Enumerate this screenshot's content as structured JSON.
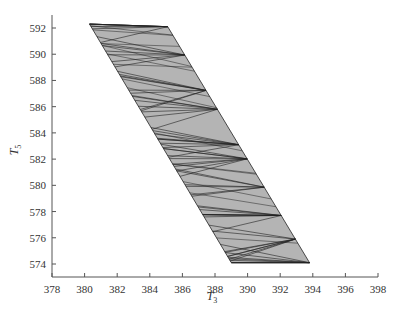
{
  "chart_data": {
    "type": "area",
    "title": "",
    "xlabel": "T3",
    "ylabel": "T5",
    "xlabel_main": "T",
    "xlabel_sub": "3",
    "ylabel_main": "T",
    "ylabel_sub": "5",
    "xlim": [
      378,
      398
    ],
    "ylim": [
      573,
      593
    ],
    "xticks": [
      378,
      380,
      382,
      384,
      386,
      388,
      390,
      392,
      394,
      396,
      398
    ],
    "yticks": [
      574,
      576,
      578,
      580,
      582,
      584,
      586,
      588,
      590,
      592
    ],
    "grid": false,
    "legend": null,
    "region": {
      "description": "Triangulated parallelogram feasible region (gray fill with dark mesh edges)",
      "fill": "#b4b4b4",
      "edge": "#222222",
      "vertices": [
        {
          "x": 380.3,
          "y": 592.3
        },
        {
          "x": 385.1,
          "y": 592.1
        },
        {
          "x": 393.8,
          "y": 574.1
        },
        {
          "x": 389.0,
          "y": 574.1
        }
      ]
    }
  }
}
